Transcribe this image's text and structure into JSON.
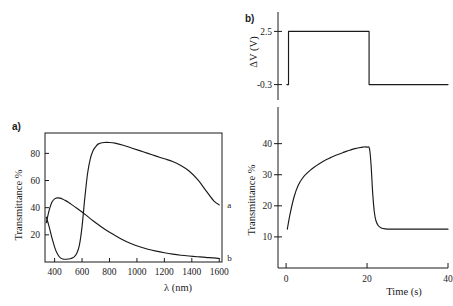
{
  "figure": {
    "background_color": "#ffffff",
    "ink_color": "#1a1a1a",
    "panel_a_label": "a)",
    "panel_b_label": "b)"
  },
  "chart_data": [
    {
      "id": "panel-a-spectra",
      "type": "line",
      "title": "",
      "panel_label": "a)",
      "xlabel": "λ (nm)",
      "ylabel": "Transmittance %",
      "xlim": [
        330,
        1620
      ],
      "ylim": [
        0,
        95
      ],
      "xticks": [
        400,
        600,
        800,
        1000,
        1200,
        1400,
        1600
      ],
      "xtick_labels": [
        "400",
        "600",
        "800",
        "1000",
        "1200",
        "1400",
        "1600"
      ],
      "yticks": [
        20,
        40,
        60,
        80
      ],
      "ytick_labels": [
        "20",
        "40",
        "60",
        "80"
      ],
      "grid": false,
      "frame": "box",
      "legend_position": "inline-right",
      "annotations": [
        {
          "text": "a",
          "x": 1615,
          "y": 42
        },
        {
          "text": "b",
          "x": 1615,
          "y": 3
        }
      ],
      "series": [
        {
          "name": "a",
          "label": "a",
          "description": "bleached state transmittance spectrum",
          "x": [
            340,
            360,
            380,
            400,
            420,
            440,
            460,
            480,
            500,
            520,
            540,
            560,
            580,
            600,
            620,
            640,
            660,
            680,
            700,
            720,
            760,
            800,
            840,
            900,
            960,
            1020,
            1080,
            1140,
            1200,
            1260,
            1320,
            1380,
            1440,
            1500,
            1560,
            1600
          ],
          "y": [
            33,
            26,
            18,
            11,
            6,
            3.2,
            2.2,
            2.0,
            2.2,
            2.6,
            3.6,
            6.0,
            12,
            26,
            47,
            65,
            76,
            82,
            85,
            87,
            88,
            88,
            87.5,
            86,
            84,
            82,
            80,
            78,
            76,
            74,
            71,
            67,
            61,
            53,
            45,
            42
          ]
        },
        {
          "name": "b",
          "label": "b",
          "description": "colored state transmittance spectrum",
          "x": [
            340,
            360,
            380,
            400,
            420,
            440,
            460,
            480,
            500,
            520,
            560,
            600,
            640,
            680,
            720,
            780,
            840,
            900,
            960,
            1020,
            1080,
            1140,
            1200,
            1260,
            1320,
            1380,
            1440,
            1500,
            1560,
            1600
          ],
          "y": [
            29,
            38,
            44,
            46.5,
            47.2,
            47,
            46.2,
            45.2,
            44,
            42.6,
            39.8,
            36.8,
            33.6,
            30.4,
            27.4,
            23.2,
            19.6,
            16.2,
            13.4,
            11.2,
            9.4,
            8.0,
            6.8,
            5.8,
            5.0,
            4.4,
            3.9,
            3.4,
            3.0,
            2.6
          ]
        }
      ]
    },
    {
      "id": "panel-b-voltage",
      "type": "line",
      "title": "",
      "panel_label": "b)",
      "xlabel": "",
      "ylabel": "ΔV (V)",
      "xlim": [
        -2,
        40
      ],
      "ylim": [
        -0.9,
        3.1
      ],
      "xticks": [],
      "xtick_labels": [],
      "yticks": [
        2.5,
        -0.3
      ],
      "ytick_labels": [
        "2.5",
        "-0.3"
      ],
      "grid": false,
      "frame": "y-axis-only",
      "series": [
        {
          "name": "applied-voltage-step",
          "label": "ΔV",
          "description": "square voltage pulse: -0.3 V baseline, step to 2.5 V at t=0.6 s, back to -0.3 V at t=20.5 s",
          "x": [
            0.2,
            0.6,
            0.6,
            20.5,
            20.5,
            40
          ],
          "y": [
            -0.3,
            -0.3,
            2.5,
            2.5,
            -0.3,
            -0.3
          ]
        }
      ]
    },
    {
      "id": "panel-b-transmittance",
      "type": "line",
      "title": "",
      "panel_label": "",
      "xlabel": "Time (s)",
      "ylabel": "Transmittance %",
      "xlim": [
        -2,
        40
      ],
      "ylim": [
        0,
        46
      ],
      "xticks": [
        0,
        20,
        40
      ],
      "xtick_labels": [
        "0",
        "20",
        "40"
      ],
      "yticks": [
        10,
        20,
        30,
        40
      ],
      "ytick_labels": [
        "10",
        "20",
        "30",
        "40"
      ],
      "grid": false,
      "frame": "left-bottom-axes",
      "series": [
        {
          "name": "transmittance-response",
          "label": "Transmittance %",
          "description": "switching response: rises from 12.5% to 39% during the 2.5 V pulse, then decays back to 12.5%",
          "x": [
            0.3,
            1,
            2,
            3,
            4,
            5,
            6,
            7,
            8,
            9,
            10,
            11,
            12,
            13,
            14,
            15,
            16,
            17,
            18,
            19,
            20,
            20.6,
            21,
            21.4,
            21.8,
            22.2,
            22.8,
            23.5,
            24.5,
            26,
            28,
            31,
            34,
            37,
            40
          ],
          "y": [
            12.5,
            17.5,
            23.0,
            26.6,
            28.8,
            30.3,
            31.5,
            32.5,
            33.4,
            34.2,
            34.9,
            35.5,
            36.1,
            36.6,
            37.1,
            37.6,
            38.0,
            38.4,
            38.7,
            38.9,
            38.9,
            38.4,
            33.0,
            24.0,
            18.0,
            15.2,
            13.6,
            12.9,
            12.6,
            12.5,
            12.5,
            12.5,
            12.5,
            12.5,
            12.5
          ]
        }
      ]
    }
  ]
}
